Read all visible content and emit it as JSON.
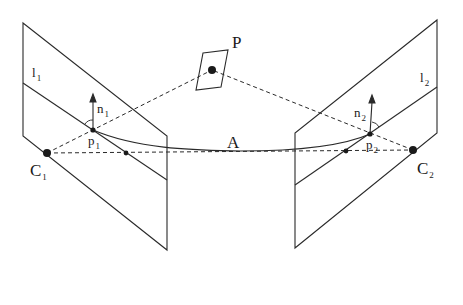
{
  "diagram": {
    "type": "two-view epipolar geometry",
    "colors": {
      "stroke": "#2a2a2a",
      "background": "#ffffff"
    },
    "labels": {
      "P": {
        "main": "P",
        "sub": ""
      },
      "A": {
        "main": "A",
        "sub": ""
      },
      "C1": {
        "main": "C",
        "sub": "1"
      },
      "C2": {
        "main": "C",
        "sub": "2"
      },
      "p1": {
        "main": "p",
        "sub": "1"
      },
      "p2": {
        "main": "p",
        "sub": "2"
      },
      "n1": {
        "main": "n",
        "sub": "1"
      },
      "n2": {
        "main": "n",
        "sub": "2"
      },
      "l1": {
        "main": "l",
        "sub": "1"
      },
      "l2": {
        "main": "l",
        "sub": "2"
      }
    },
    "nodes": [
      {
        "id": "P",
        "x": 212,
        "y": 70
      },
      {
        "id": "C1",
        "x": 47,
        "y": 153
      },
      {
        "id": "C2",
        "x": 413,
        "y": 150
      },
      {
        "id": "p1",
        "x": 93,
        "y": 130
      },
      {
        "id": "p2",
        "x": 370,
        "y": 134
      },
      {
        "id": "e1",
        "x": 126,
        "y": 153
      },
      {
        "id": "e2",
        "x": 346,
        "y": 151
      }
    ],
    "edges": [
      {
        "from": "C1",
        "to": "P",
        "style": "dashed"
      },
      {
        "from": "C2",
        "to": "P",
        "style": "dashed"
      },
      {
        "from": "C1",
        "to": "C2",
        "style": "dashed",
        "label": "baseline"
      },
      {
        "from": "p1",
        "to": "p2",
        "style": "solid-curve",
        "label": "A"
      }
    ]
  }
}
